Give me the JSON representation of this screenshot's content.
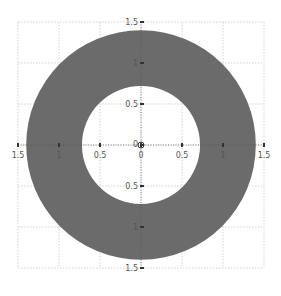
{
  "chart_data": {
    "type": "area",
    "title": "",
    "xlabel": "",
    "ylabel": "",
    "shape": {
      "kind": "annulus",
      "center": [
        0,
        0
      ],
      "outer_radius": 1.4,
      "inner_radius": 0.72,
      "fill_color": "#6b6b6b"
    },
    "xlim": [
      -1.5,
      1.5
    ],
    "ylim": [
      -1.5,
      1.5
    ],
    "grid": true,
    "axes_at_origin": true,
    "x_ticks": [
      {
        "value": -1.5,
        "label": "1.5"
      },
      {
        "value": -1,
        "label": "1"
      },
      {
        "value": -0.5,
        "label": "0.5"
      },
      {
        "value": 0,
        "label": "0"
      },
      {
        "value": 0.5,
        "label": "0.5"
      },
      {
        "value": 1,
        "label": "1"
      },
      {
        "value": 1.5,
        "label": "1.5"
      }
    ],
    "y_ticks": [
      {
        "value": 1.5,
        "label": "1.5"
      },
      {
        "value": 1,
        "label": "1"
      },
      {
        "value": 0.5,
        "label": "0.5"
      },
      {
        "value": 0,
        "label": "0"
      },
      {
        "value": -0.5,
        "label": "0.5"
      },
      {
        "value": -1,
        "label": "1"
      },
      {
        "value": -1.5,
        "label": "1.5"
      }
    ]
  },
  "colors": {
    "ring": "#6b6b6b",
    "grid": "#c8c8c8",
    "axis": "#333333",
    "label": "#555555"
  }
}
